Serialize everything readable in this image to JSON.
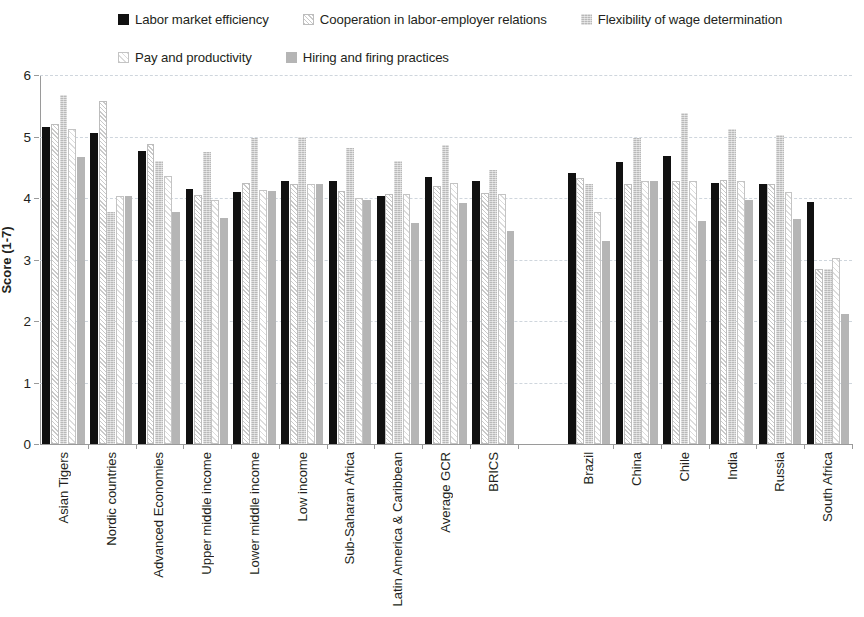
{
  "legend": {
    "rows": [
      [
        {
          "label": "Labor market efficiency",
          "fill": "s1",
          "color": "#111111"
        },
        {
          "label": "Cooperation in labor-employer relations",
          "fill": "s2",
          "color": "#ffffff"
        },
        {
          "label": "Flexibility of wage determination",
          "fill": "s3",
          "color": "#b9b9b9"
        }
      ],
      [
        {
          "label": "Pay and productivity",
          "fill": "s4",
          "color": "#ffffff"
        },
        {
          "label": "Hiring and firing practices",
          "fill": "s5",
          "color": "#b5b5b5"
        }
      ]
    ]
  },
  "axis": {
    "y_title": "Score (1-7)",
    "y_ticks": [
      "0",
      "1",
      "2",
      "3",
      "4",
      "5",
      "6"
    ],
    "y_min": 0,
    "y_max": 6
  },
  "chart_data": {
    "type": "bar",
    "title": "",
    "xlabel": "",
    "ylabel": "Score (1-7)",
    "ylim": [
      0,
      6
    ],
    "grid": true,
    "legend_position": "top",
    "gap_after_category": "BRICS",
    "categories": [
      "Asian Tigers",
      "Nordic countries",
      "Advanced Economies",
      "Upper middle income",
      "Lower middle income",
      "Low income",
      "Sub-Saharan Africa",
      "Latin America & Caribbean",
      "Average GCR",
      "BRICS",
      "Brazil",
      "China",
      "Chile",
      "India",
      "Russia",
      "South Africa"
    ],
    "series": [
      {
        "name": "Labor market efficiency",
        "fill": "s1",
        "values": [
          5.15,
          5.05,
          4.77,
          4.15,
          4.09,
          4.28,
          4.28,
          4.03,
          4.34,
          4.28,
          4.4,
          4.58,
          4.68,
          4.24,
          4.23,
          3.93
        ]
      },
      {
        "name": "Cooperation in labor-employer relations",
        "fill": "s2",
        "values": [
          5.2,
          5.58,
          4.88,
          4.05,
          4.24,
          4.23,
          4.12,
          4.06,
          4.19,
          4.08,
          4.32,
          4.22,
          4.28,
          4.3,
          4.23,
          2.85
        ]
      },
      {
        "name": "Flexibility of wage determination",
        "fill": "s3",
        "values": [
          5.67,
          3.78,
          4.6,
          4.75,
          4.98,
          4.99,
          4.82,
          4.61,
          4.86,
          4.45,
          4.22,
          4.98,
          5.38,
          5.12,
          5.02,
          2.85
        ]
      },
      {
        "name": "Pay and productivity",
        "fill": "s4",
        "values": [
          5.13,
          4.04,
          4.36,
          3.97,
          4.13,
          4.22,
          4.0,
          4.07,
          4.25,
          4.07,
          3.78,
          4.28,
          4.28,
          4.28,
          4.1,
          3.02
        ]
      },
      {
        "name": "Hiring and firing practices",
        "fill": "s5",
        "values": [
          4.66,
          4.04,
          3.78,
          3.68,
          4.11,
          4.22,
          3.96,
          3.59,
          3.92,
          3.46,
          3.3,
          4.28,
          3.63,
          3.97,
          3.66,
          2.12
        ]
      }
    ]
  }
}
